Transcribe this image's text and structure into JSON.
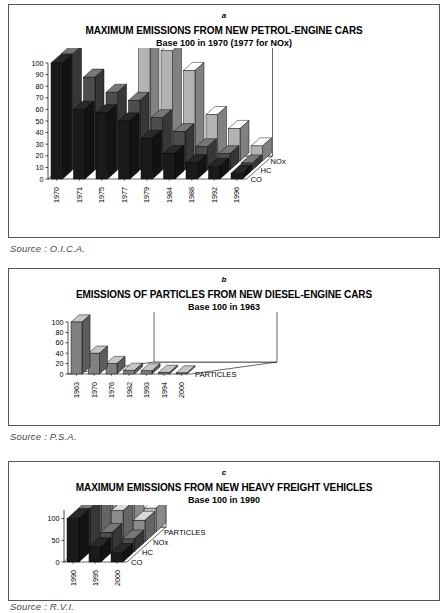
{
  "page": {
    "background": "#ffffff",
    "panel_border": "#58585a"
  },
  "panels": [
    {
      "id": "a",
      "figure_letter": "a",
      "title_line1": "MAXIMUM EMISSIONS FROM NEW PETROL-ENGINE CARS",
      "title_line2": "Base 100 in 1970 (1977 for NOx)",
      "source": "Source :  O.I.C.A."
    },
    {
      "id": "b",
      "figure_letter": "b",
      "title_line1": "EMISSIONS OF PARTICLES FROM NEW DIESEL-ENGINE CARS",
      "title_line2": "Base 100 in 1963",
      "source": "Source :  P.S.A."
    },
    {
      "id": "c",
      "figure_letter": "c",
      "title_line1": "MAXIMUM EMISSIONS FROM NEW HEAVY FREIGHT VEHICLES",
      "title_line2": "Base 100 in 1990",
      "source": "Source :  R.V.I."
    }
  ],
  "chart_data": [
    {
      "type": "bar",
      "id": "a",
      "style": "3d-grouped-bar",
      "title": "MAXIMUM EMISSIONS FROM NEW PETROL-ENGINE CARS",
      "subtitle": "Base 100 in 1970 (1977 for NOx)",
      "xlabel": "",
      "ylabel": "",
      "ylim": [
        0,
        100
      ],
      "yticks": [
        0,
        10,
        20,
        30,
        40,
        50,
        60,
        70,
        80,
        90,
        100
      ],
      "grid": false,
      "legend_position": "depth-axis-right",
      "categories": [
        "1970",
        "1971",
        "1975",
        "1977",
        "1979",
        "1984",
        "1988",
        "1992",
        "1996"
      ],
      "depth_labels": [
        "CO",
        "HC",
        "NOx"
      ],
      "series": [
        {
          "name": "CO",
          "color": "#1a1a1a",
          "values": [
            100,
            60,
            57,
            50,
            35,
            22,
            14,
            11,
            5
          ]
        },
        {
          "name": "HC",
          "color": "#4d4d4d",
          "values": [
            100,
            80,
            67,
            60,
            45,
            33,
            20,
            14,
            6
          ]
        },
        {
          "name": "NOx",
          "color": "#b3b3b3",
          "values": [
            null,
            null,
            null,
            100,
            95,
            78,
            40,
            28,
            13
          ]
        }
      ]
    },
    {
      "type": "bar",
      "id": "b",
      "style": "3d-single-bar",
      "title": "EMISSIONS OF PARTICLES FROM NEW DIESEL-ENGINE CARS",
      "subtitle": "Base 100 in 1963",
      "xlabel": "",
      "ylabel": "",
      "ylim": [
        0,
        100
      ],
      "yticks": [
        0,
        20,
        40,
        60,
        80,
        100
      ],
      "grid": false,
      "legend_position": "depth-axis-right",
      "categories": [
        "1963",
        "1970",
        "1976",
        "1982",
        "1993",
        "1994",
        "2000"
      ],
      "depth_labels": [
        "PARTICLES"
      ],
      "series": [
        {
          "name": "PARTICLES",
          "color": "#808080",
          "values": [
            100,
            40,
            20,
            7,
            6,
            3,
            2
          ]
        }
      ]
    },
    {
      "type": "bar",
      "id": "c",
      "style": "3d-grouped-bar",
      "title": "MAXIMUM EMISSIONS FROM NEW HEAVY FREIGHT VEHICLES",
      "subtitle": "Base 100 in 1990",
      "xlabel": "",
      "ylabel": "",
      "ylim": [
        0,
        120
      ],
      "yticks": [
        0,
        50,
        100
      ],
      "grid": false,
      "legend_position": "depth-axis-right",
      "categories": [
        "1990",
        "1995",
        "2000"
      ],
      "depth_labels": [
        "CO",
        "HC",
        "NOx",
        "PARTICLES"
      ],
      "series": [
        {
          "name": "CO",
          "color": "#1a1a1a",
          "values": [
            100,
            35,
            22
          ]
        },
        {
          "name": "HC",
          "color": "#4d4d4d",
          "values": [
            100,
            45,
            30
          ]
        },
        {
          "name": "NOx",
          "color": "#8c8c8c",
          "values": [
            100,
            72,
            50
          ]
        },
        {
          "name": "PARTICLES",
          "color": "#bfbfbf",
          "values": [
            100,
            88,
            55
          ]
        }
      ]
    }
  ]
}
